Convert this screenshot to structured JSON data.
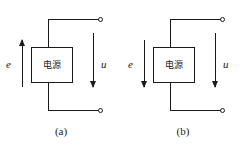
{
  "figure": {
    "background_color": "#ffffff",
    "line_color": "#1a1a1a",
    "type": "electrical-circuit-diagram"
  },
  "circuits": [
    {
      "id": "a",
      "caption": "(a)",
      "source_box": {
        "label": "电源",
        "meaning": "power source"
      },
      "emf": {
        "label": "e",
        "icon": "arrow-up-icon",
        "direction": "up"
      },
      "voltage": {
        "label": "u",
        "icon": "arrow-down-icon",
        "direction": "down"
      },
      "terminals": [
        {
          "name": "top-terminal",
          "icon": "open-circle-terminal-icon",
          "position": "top-right"
        },
        {
          "name": "bottom-terminal",
          "icon": "open-circle-terminal-icon",
          "position": "bottom-right"
        }
      ]
    },
    {
      "id": "b",
      "caption": "(b)",
      "source_box": {
        "label": "电源",
        "meaning": "power source"
      },
      "emf": {
        "label": "e",
        "icon": "arrow-down-icon",
        "direction": "down"
      },
      "voltage": {
        "label": "u",
        "icon": "arrow-down-icon",
        "direction": "down"
      },
      "terminals": [
        {
          "name": "top-terminal",
          "icon": "open-circle-terminal-icon",
          "position": "top-right"
        },
        {
          "name": "bottom-terminal",
          "icon": "open-circle-terminal-icon",
          "position": "bottom-right"
        }
      ]
    }
  ]
}
